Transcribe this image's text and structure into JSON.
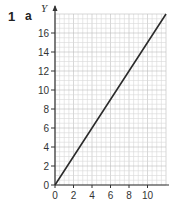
{
  "question": {
    "number": "1",
    "part": "a"
  },
  "chart_data": {
    "type": "line",
    "title": "",
    "xlabel": "x",
    "ylabel": "Y",
    "xlim": [
      0,
      12
    ],
    "ylim": [
      0,
      18
    ],
    "x_ticks": [
      0,
      2,
      4,
      6,
      8,
      10
    ],
    "y_ticks": [
      0,
      2,
      4,
      6,
      8,
      10,
      12,
      14,
      16
    ],
    "grid": true,
    "legend": null,
    "series": [
      {
        "name": "line",
        "x": [
          0,
          4,
          8,
          12
        ],
        "y": [
          0,
          6,
          12,
          18
        ],
        "color": "#2b2b2b"
      }
    ]
  },
  "colors": {
    "grid_minor": "#d9d9d9",
    "grid_major": "#bdbdbd",
    "axis": "#333333",
    "line": "#2b2b2b"
  }
}
